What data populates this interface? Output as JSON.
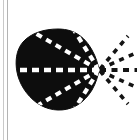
{
  "figure": {
    "title": "Radial dashed-line diagram over solid blob",
    "caption": "",
    "canvas": {
      "width": 138,
      "height": 140,
      "background": "#ffffff"
    },
    "colors": {
      "blob_fill": "#0d0d0d",
      "inner_dash": "#ffffff",
      "outer_dash": "#141414",
      "scan_line_outer": "#c9c9c9",
      "scan_line_inner": "#b4b4b4"
    },
    "blob": {
      "name": "solid-blob",
      "shape": "teardrop-rounded-polygon",
      "bounds": {
        "x": 16,
        "y": 29,
        "width": 84,
        "height": 82
      },
      "vertex": {
        "x": 99,
        "y": 70
      },
      "fill": "#0d0d0d"
    },
    "inner_rays": [
      {
        "id": "ray-up-steep",
        "angle_deg": -58,
        "dash": "6 5",
        "width": 4.2
      },
      {
        "id": "ray-up-shallow",
        "angle_deg": -30,
        "dash": "6 5",
        "width": 4.2
      },
      {
        "id": "ray-center",
        "angle_deg": 0,
        "dash": "7 5",
        "width": 4.6
      },
      {
        "id": "ray-dn-shallow",
        "angle_deg": 30,
        "dash": "6 5",
        "width": 4.2
      },
      {
        "id": "ray-dn-steep",
        "angle_deg": 58,
        "dash": "6 5",
        "width": 4.2
      }
    ],
    "outer_rays": [
      {
        "id": "out-ray-up-steep",
        "angle_deg": -50,
        "dash": "5 5",
        "width": 3.6
      },
      {
        "id": "out-ray-up-shallow",
        "angle_deg": -24,
        "dash": "5 5",
        "width": 3.6
      },
      {
        "id": "out-ray-center",
        "angle_deg": 0,
        "dash": "6 5",
        "width": 3.8
      },
      {
        "id": "out-ray-dn-shallow",
        "angle_deg": 24,
        "dash": "5 5",
        "width": 3.6
      },
      {
        "id": "out-ray-dn-steep",
        "angle_deg": 50,
        "dash": "5 5",
        "width": 3.6
      }
    ],
    "scan_lines": [
      {
        "id": "scan-line-outer",
        "x": 3,
        "color": "#c9c9c9"
      },
      {
        "id": "scan-line-inner",
        "x": 7,
        "color": "#b4b4b4"
      }
    ]
  }
}
